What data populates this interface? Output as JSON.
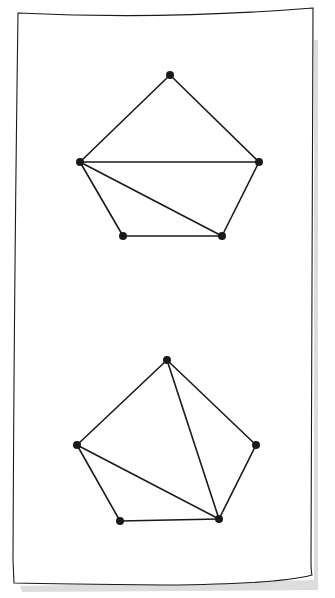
{
  "diagram": {
    "title": "",
    "colors": {
      "ink": "#1a1a1a",
      "paper": "#ffffff",
      "shadow": "#c8c8c8"
    },
    "paper": {
      "border": "M18,13 Q165,20 313,8 L311,560 Q311,572 312,575 Q280,584 165,585 Q60,584 14,583 L13,560 Q14,300 18,13 Z"
    },
    "figures": [
      {
        "name": "pentagon-top",
        "vertices": [
          [
            170,
            75
          ],
          [
            259,
            162
          ],
          [
            222,
            236
          ],
          [
            123,
            236
          ],
          [
            80,
            162
          ]
        ],
        "edges": [
          [
            0,
            1
          ],
          [
            1,
            2
          ],
          [
            2,
            3
          ],
          [
            3,
            4
          ],
          [
            4,
            0
          ]
        ],
        "diagonals": [
          [
            4,
            1
          ],
          [
            4,
            2
          ]
        ]
      },
      {
        "name": "pentagon-bottom",
        "vertices": [
          [
            167,
            360
          ],
          [
            256,
            445
          ],
          [
            219,
            519
          ],
          [
            120,
            521
          ],
          [
            77,
            445
          ]
        ],
        "edges": [
          [
            0,
            1
          ],
          [
            1,
            2
          ],
          [
            2,
            3
          ],
          [
            3,
            4
          ],
          [
            4,
            0
          ]
        ],
        "diagonals": [
          [
            0,
            2
          ],
          [
            4,
            2
          ]
        ]
      }
    ]
  }
}
